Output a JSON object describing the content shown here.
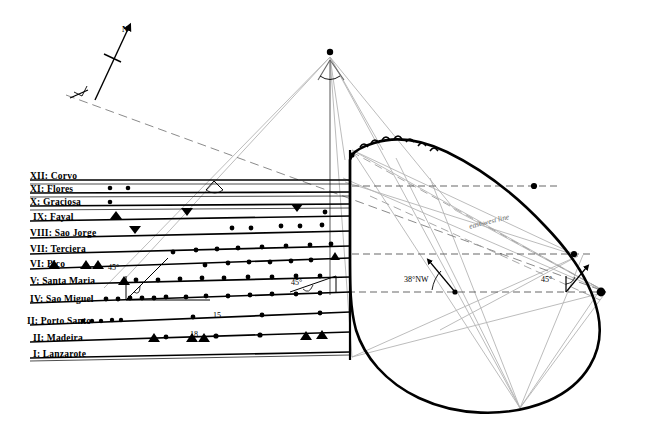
{
  "figure": {
    "compass": {
      "north_label": "N"
    },
    "east_west_line_label": "east-west line",
    "angles": [
      {
        "id": "angle-45-left",
        "value": "45°"
      },
      {
        "id": "angle-45-mid",
        "value": "45°"
      },
      {
        "id": "angle-45-right",
        "value": "45°"
      },
      {
        "id": "angle-38-nw",
        "value": "38°NW"
      }
    ],
    "numbers": [
      {
        "id": "number-15",
        "value": "15"
      },
      {
        "id": "number-18",
        "value": "18"
      }
    ]
  },
  "rows": [
    {
      "numeral": "XII",
      "name": "Corvo",
      "label": "XII:  Corvo"
    },
    {
      "numeral": "XI",
      "name": "Flores",
      "label": "XI:  Flores"
    },
    {
      "numeral": "X",
      "name": "Graciosa",
      "label": "X:  Graciosa"
    },
    {
      "numeral": "IX",
      "name": "Fayal",
      "label": "IX:  Fayal"
    },
    {
      "numeral": "VIII",
      "name": "Sao Jorge",
      "label": "VIII:  Sao Jorge"
    },
    {
      "numeral": "VII",
      "name": "Terciera",
      "label": "VII:  Terciera"
    },
    {
      "numeral": "VI",
      "name": "Pico",
      "label": "VI:     Pico"
    },
    {
      "numeral": "V",
      "name": "Santa Maria",
      "label": "V:  Santa Maria"
    },
    {
      "numeral": "IV",
      "name": "Sao Miguel",
      "label": "IV:  Sao Miguel"
    },
    {
      "numeral": "III",
      "name": "Porto Santo",
      "label": "II:  Porto Santo"
    },
    {
      "numeral": "II",
      "name": "Madeira",
      "label": "II:  Madeira"
    },
    {
      "numeral": "I",
      "name": "Lanzarote",
      "label": "I:  Lanzarote"
    }
  ],
  "curve_points": [
    {
      "id": "point-Q",
      "label": "Q"
    },
    {
      "id": "point-S",
      "label": "S"
    },
    {
      "id": "point-P",
      "label": "P"
    },
    {
      "id": "point-R",
      "label": "R"
    },
    {
      "id": "point-M",
      "label": "M"
    },
    {
      "id": "point-T",
      "label": "T"
    },
    {
      "id": "point-I",
      "label": "I"
    },
    {
      "id": "point-J",
      "label": "J"
    },
    {
      "id": "point-H",
      "label": "H"
    },
    {
      "id": "point-G",
      "label": "G"
    },
    {
      "id": "point-F",
      "label": "F"
    },
    {
      "id": "point-E",
      "label": "E"
    },
    {
      "id": "point-D",
      "label": "D"
    },
    {
      "id": "point-XII",
      "label": "XII"
    },
    {
      "id": "point-XI",
      "label": "XI"
    },
    {
      "id": "point-VI",
      "label": "VI"
    },
    {
      "id": "point-IV",
      "label": "IV"
    }
  ],
  "region_labels": [
    {
      "id": "label-azores",
      "text": "Azores"
    },
    {
      "id": "label-c-madeira",
      "text": "C Madeira"
    },
    {
      "id": "label-b-cape",
      "text": "B Cape Finisterre"
    },
    {
      "id": "label-a-menec",
      "text": "A Menec"
    }
  ],
  "colors": {
    "ink": "#000000",
    "faint": "#9a9a9a",
    "dashed": "#555555",
    "background": "#ffffff"
  }
}
